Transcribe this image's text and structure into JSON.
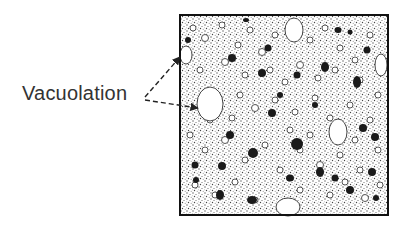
{
  "diagram": {
    "label": "Vacuolation",
    "colors": {
      "background": "#ffffff",
      "stipple": "#8a8a8a",
      "border": "#111111",
      "dark_bodies": "#1a1a1a",
      "label_text": "#333333"
    }
  }
}
